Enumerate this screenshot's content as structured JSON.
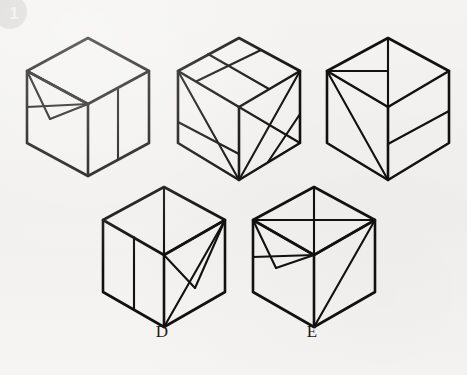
{
  "page": {
    "badge_number": "1",
    "background_color": "#f2f1ef",
    "line_color": "#111111",
    "width": 467,
    "height": 375
  },
  "figure": {
    "type": "isometric-cube-puzzle",
    "cubes": [
      {
        "id": "cube-a",
        "label": "",
        "position": {
          "x": 22,
          "y": 32
        },
        "size": {
          "w": 130,
          "h": 148
        },
        "faces": {
          "top": "plain with horizontal edge band near front",
          "left": "fan of triangles from top-left vertex",
          "right": "single vertical line"
        }
      },
      {
        "id": "cube-b",
        "label": "",
        "position": {
          "x": 172,
          "y": 32
        },
        "size": {
          "w": 132,
          "h": 152
        },
        "faces": {
          "top": "parallel band stripe",
          "left": "diagonal from top-left to bottom vertex plus horizontal band",
          "right": "crossed diagonals forming X"
        }
      },
      {
        "id": "cube-c",
        "label": "",
        "position": {
          "x": 322,
          "y": 32
        },
        "size": {
          "w": 130,
          "h": 152
        },
        "faces": {
          "top": "vertical line from apex to center plus horizontal line to left vertex",
          "left": "diagonal from top-left vertex to bottom vertex",
          "right": "horizontal band stripe"
        }
      },
      {
        "id": "cube-d",
        "label": "D",
        "position": {
          "x": 98,
          "y": 182
        },
        "size": {
          "w": 130,
          "h": 148
        },
        "faces": {
          "top": "vertical line from apex to center",
          "left": "single vertical line",
          "right": "triangle from top-right vertex to center plus diagonal to bottom"
        }
      },
      {
        "id": "cube-e",
        "label": "E",
        "position": {
          "x": 248,
          "y": 182
        },
        "size": {
          "w": 130,
          "h": 148
        },
        "faces": {
          "top": "vertical line from apex to center plus horizontal line across",
          "left": "fan of triangles from top-left vertex",
          "right": "diagonal from top-right vertex to bottom vertex"
        }
      }
    ],
    "labels": [
      {
        "name": "label-d",
        "text": "D",
        "x": 147,
        "y": 330
      },
      {
        "name": "label-e",
        "text": "E",
        "x": 297,
        "y": 330
      }
    ]
  }
}
